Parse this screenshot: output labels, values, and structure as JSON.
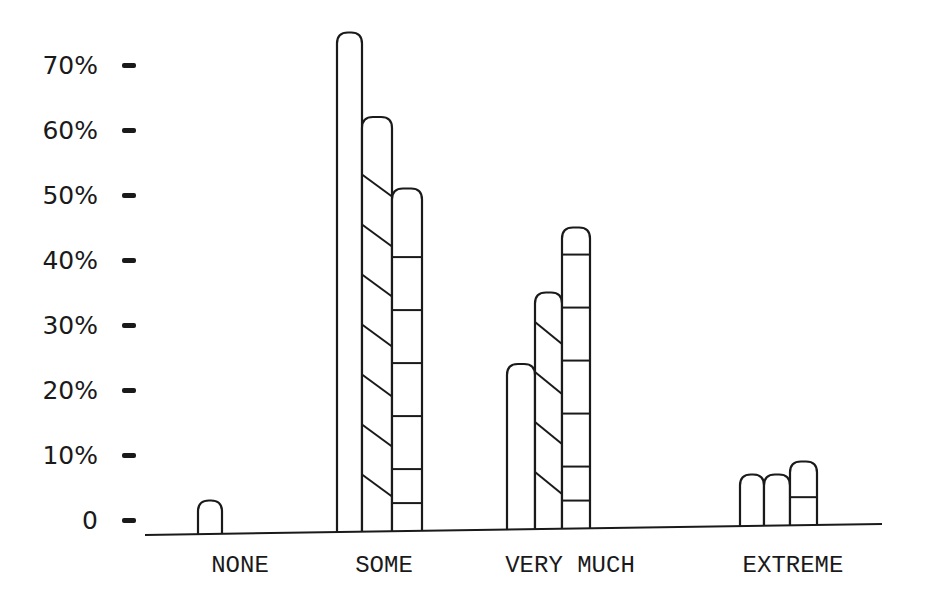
{
  "chart_data": {
    "type": "bar",
    "title": "",
    "xlabel": "",
    "ylabel": "",
    "ylim": [
      0,
      70
    ],
    "grid": false,
    "legend": null,
    "y_ticks": [
      "0",
      "10%",
      "20%",
      "30%",
      "40%",
      "50%",
      "60%",
      "70%"
    ],
    "y_tick_values": [
      0,
      10,
      20,
      30,
      40,
      50,
      60,
      70
    ],
    "categories": [
      "NONE",
      "SOME",
      "VERY MUCH",
      "EXTREME"
    ],
    "series": [
      {
        "name": "Series 1 (plain)",
        "pattern": "plain",
        "values": [
          3,
          75,
          24,
          7
        ]
      },
      {
        "name": "Series 2 (diagonal hatch)",
        "pattern": "diagonal",
        "values": [
          null,
          62,
          35,
          7
        ]
      },
      {
        "name": "Series 3 (horizontal hatch)",
        "pattern": "horizontal",
        "values": [
          null,
          51,
          45,
          9
        ]
      }
    ]
  },
  "style": {
    "ink": "#1a1a1a",
    "paper": "#ffffff"
  }
}
